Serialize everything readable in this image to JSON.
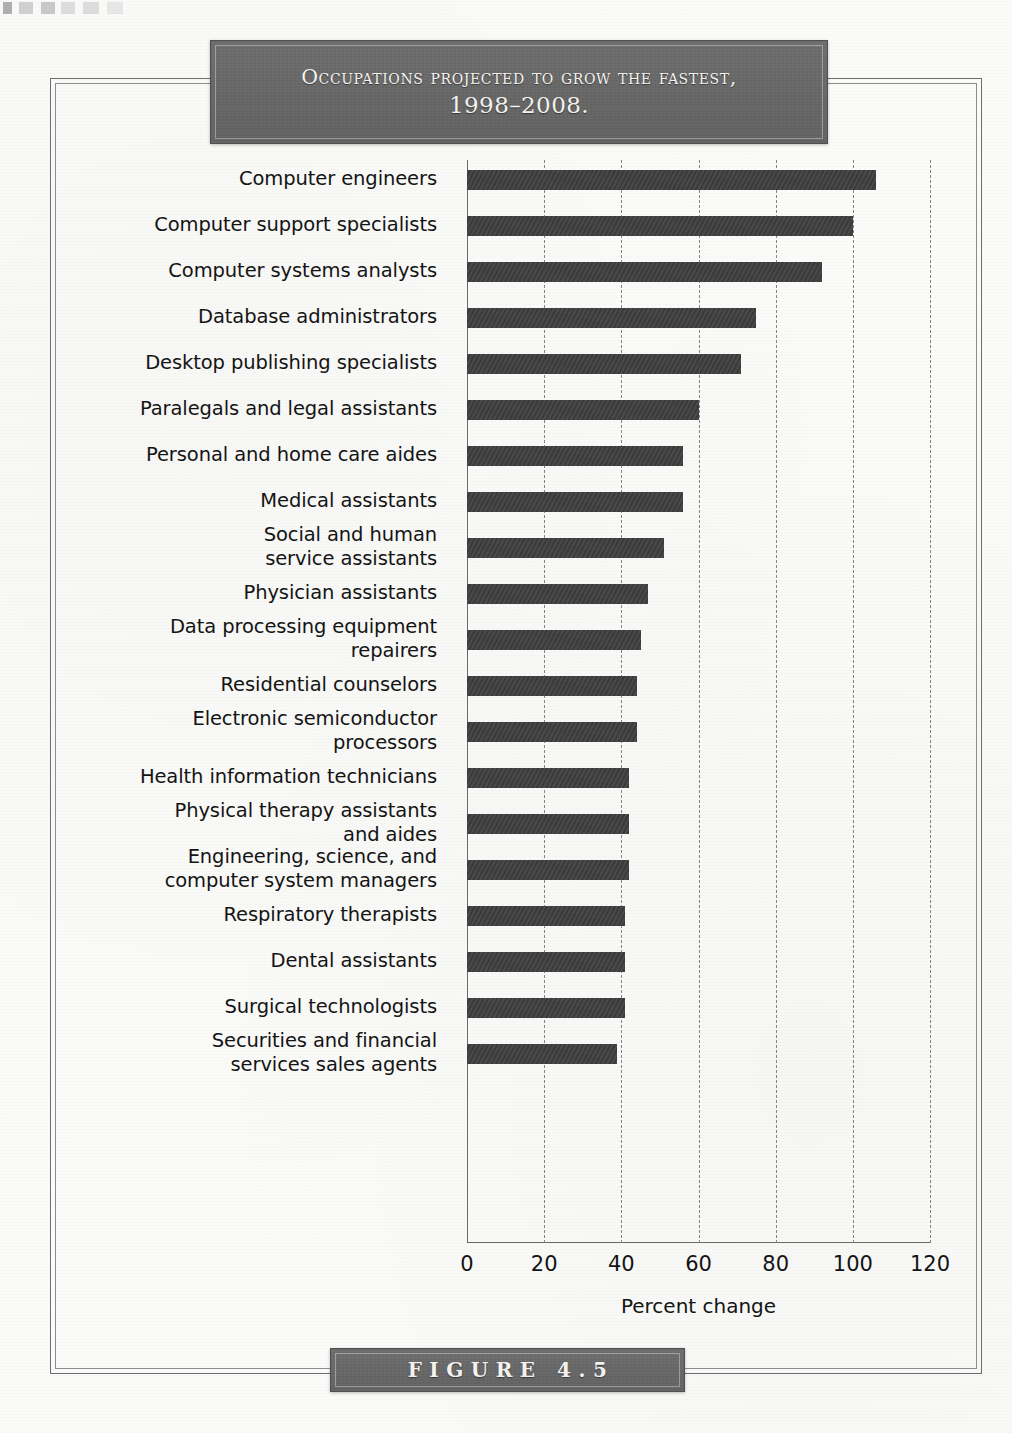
{
  "banner": {
    "title_line1": "Occupations projected to grow the fastest,",
    "title_line2": "1998–2008."
  },
  "figure": {
    "caption": "FIGURE 4.5"
  },
  "colors": {
    "bar": "#3b3b3b",
    "banner": "#676767",
    "banner_text": "#f4f2ee",
    "gridline": "#848484",
    "frame": "#6e6e6e",
    "page_background": "#fbfbf9"
  },
  "chart_data": {
    "type": "bar",
    "orientation": "horizontal",
    "title": "Occupations projected to grow the fastest, 1998–2008.",
    "xlabel": "Percent change",
    "ylabel": "",
    "xlim": [
      0,
      120
    ],
    "xticks": [
      0,
      20,
      40,
      60,
      80,
      100,
      120
    ],
    "xtick_labels": [
      "0",
      "20",
      "40",
      "60",
      "80",
      "100",
      "120"
    ],
    "grid": true,
    "grid_axis": "x",
    "grid_style": "dashed",
    "legend": false,
    "categories": [
      "Computer engineers",
      "Computer support specialists",
      "Computer systems analysts",
      "Database administrators",
      "Desktop publishing specialists",
      "Paralegals and legal assistants",
      "Personal and home care aides",
      "Medical assistants",
      "Social and human service assistants",
      "Physician assistants",
      "Data processing equipment repairers",
      "Residential counselors",
      "Electronic semiconductor processors",
      "Health information technicians",
      "Physical therapy assistants and aides",
      "Engineering, science, and computer system managers",
      "Respiratory therapists",
      "Dental assistants",
      "Surgical technologists",
      "Securities and financial services sales agents"
    ],
    "category_lines": [
      [
        "Computer engineers"
      ],
      [
        "Computer support specialists"
      ],
      [
        "Computer systems analysts"
      ],
      [
        "Database administrators"
      ],
      [
        "Desktop publishing specialists"
      ],
      [
        "Paralegals and legal assistants"
      ],
      [
        "Personal and home care aides"
      ],
      [
        "Medical assistants"
      ],
      [
        "Social and human",
        "service assistants"
      ],
      [
        "Physician assistants"
      ],
      [
        "Data processing equipment",
        "repairers"
      ],
      [
        "Residential counselors"
      ],
      [
        "Electronic semiconductor",
        "processors"
      ],
      [
        "Health information technicians"
      ],
      [
        "Physical therapy assistants",
        "and aides"
      ],
      [
        "Engineering, science, and",
        "computer system managers"
      ],
      [
        "Respiratory therapists"
      ],
      [
        "Dental assistants"
      ],
      [
        "Surgical technologists"
      ],
      [
        "Securities and financial",
        "services sales agents"
      ]
    ],
    "values": [
      106,
      100,
      92,
      75,
      71,
      60,
      56,
      56,
      51,
      47,
      45,
      44,
      44,
      42,
      42,
      42,
      41,
      41,
      41,
      39
    ],
    "units": "percent"
  }
}
